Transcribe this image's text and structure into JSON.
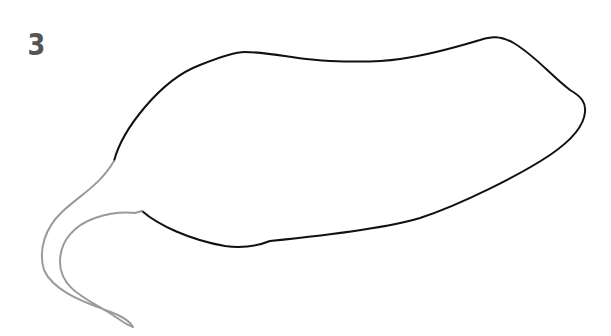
{
  "figure": {
    "label": "3",
    "colors": {
      "background": "#ffffff",
      "label": "#555555",
      "outline": "#111111",
      "tail": "#9a9a9a"
    }
  }
}
